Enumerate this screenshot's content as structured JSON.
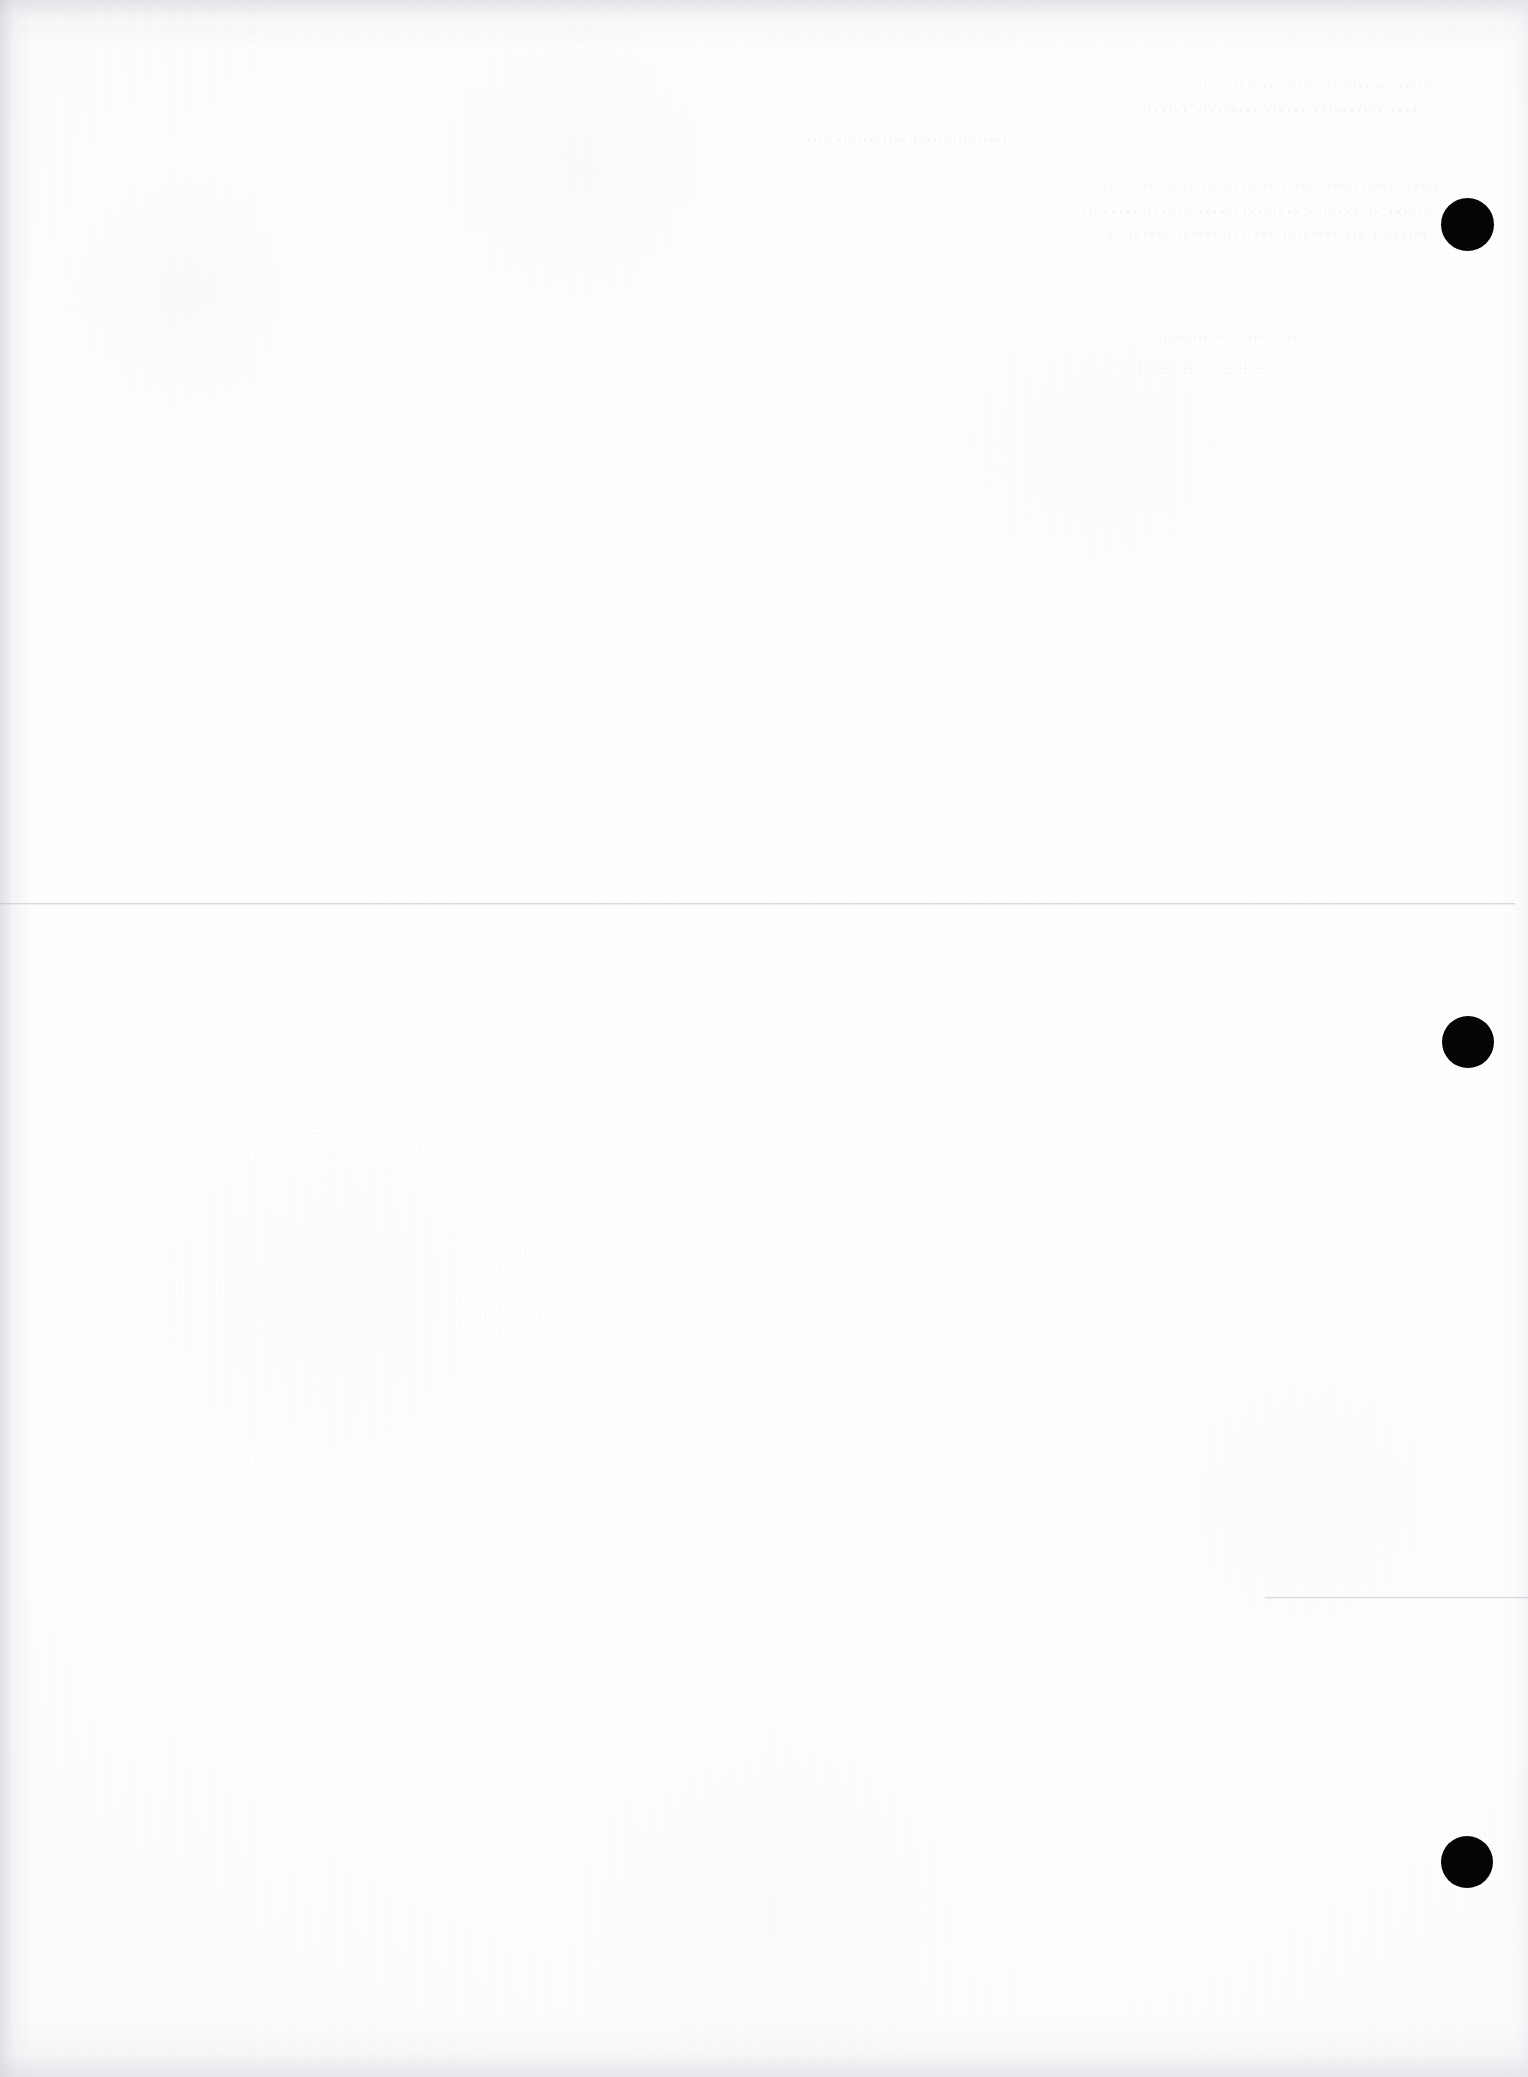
{
  "page": {
    "kind": "scanned-blank-page",
    "width": 1528,
    "height": 2077,
    "paper_color": "#fefefe",
    "ink_color": "#050505",
    "rule_color": "#a8aab2",
    "ghost_color": "#8c8e98"
  },
  "registration_dots": [
    {
      "label": "dot-1",
      "cx": 1467,
      "cy": 224,
      "diameter": 53
    },
    {
      "label": "dot-2",
      "cx": 1468,
      "cy": 1042,
      "diameter": 52
    },
    {
      "label": "dot-3",
      "cx": 1467,
      "cy": 1862,
      "diameter": 52
    }
  ],
  "rules": [
    {
      "label": "rule-upper",
      "x": 0,
      "y": 903,
      "width": 1515
    },
    {
      "label": "rule-lower",
      "x": 1265,
      "y": 1597,
      "width": 263
    }
  ],
  "ghost_text": {
    "note": "show-through from reverse side; illegible",
    "lines": [
      {
        "x": 95,
        "y": 78,
        "size": 17,
        "text": "· ····· ·· ········ ···· ······ ··· ····"
      },
      {
        "x": 110,
        "y": 100,
        "size": 20,
        "text": "···· ·········· ······ ········· ······"
      },
      {
        "x": 520,
        "y": 130,
        "size": 18,
        "text": "········ ······ ··········· ····"
      },
      {
        "x": 88,
        "y": 176,
        "size": 19,
        "text": "····· ············ ··· ········· ········ ····· ····"
      },
      {
        "x": 96,
        "y": 200,
        "size": 21,
        "text": "······ ·········· ·············· ······ ········"
      },
      {
        "x": 100,
        "y": 224,
        "size": 20,
        "text": "········ ··· ············ ·········· ······ ··"
      },
      {
        "x": 230,
        "y": 330,
        "size": 16,
        "text": "···· ······ ··· ········"
      },
      {
        "x": 250,
        "y": 360,
        "size": 16,
        "text": "······· ···· ········· ···"
      }
    ]
  }
}
